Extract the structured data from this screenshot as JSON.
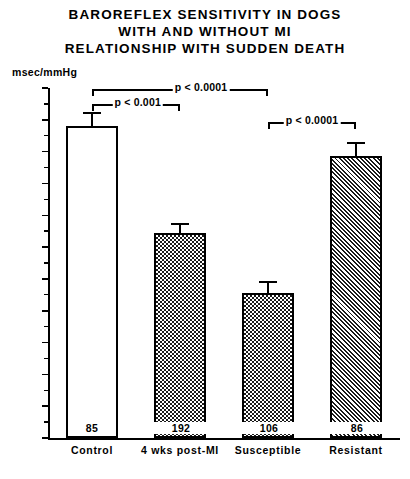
{
  "title": {
    "line1": "BAROREFLEX SENSITIVITY IN DOGS",
    "line2": "WITH AND WITHOUT MI",
    "line3": "RELATIONSHIP WITH SUDDEN DEATH"
  },
  "axis": {
    "y_unit": "msec/mmHg",
    "y_ticks": [
      "22",
      "20",
      "18",
      "16",
      "14",
      "12",
      "10",
      "8",
      "6",
      "4",
      "2",
      "0"
    ]
  },
  "annotations": {
    "sig1": "p < 0.001",
    "sig2": "p < 0.0001",
    "sig3": "p < 0.0001"
  },
  "chart_data": {
    "type": "bar",
    "title": "BAROREFLEX SENSITIVITY IN DOGS WITH AND WITHOUT MI RELATIONSHIP WITH SUDDEN DEATH",
    "xlabel": "",
    "ylabel": "msec/mmHg",
    "ylim": [
      0,
      22
    ],
    "ytick_step": 2,
    "yminor_step": 1,
    "grid": false,
    "legend": "none",
    "categories": [
      "Control",
      "4 wks post-MI",
      "Susceptible",
      "Resistant"
    ],
    "values": [
      19.6,
      12.9,
      9.1,
      17.7
    ],
    "errors": [
      0.9,
      0.6,
      0.8,
      0.9
    ],
    "n_labels": [
      "85",
      "192",
      "106",
      "86"
    ],
    "fills": [
      "white",
      "checkered",
      "checkered",
      "diagonal-hatch"
    ],
    "significance": [
      {
        "label": "p < 0.001",
        "from": "Control",
        "to": "4 wks post-MI"
      },
      {
        "label": "p < 0.0001",
        "from": "Control",
        "to": "Susceptible"
      },
      {
        "label": "p < 0.0001",
        "from": "Susceptible",
        "to": "Resistant"
      }
    ]
  }
}
